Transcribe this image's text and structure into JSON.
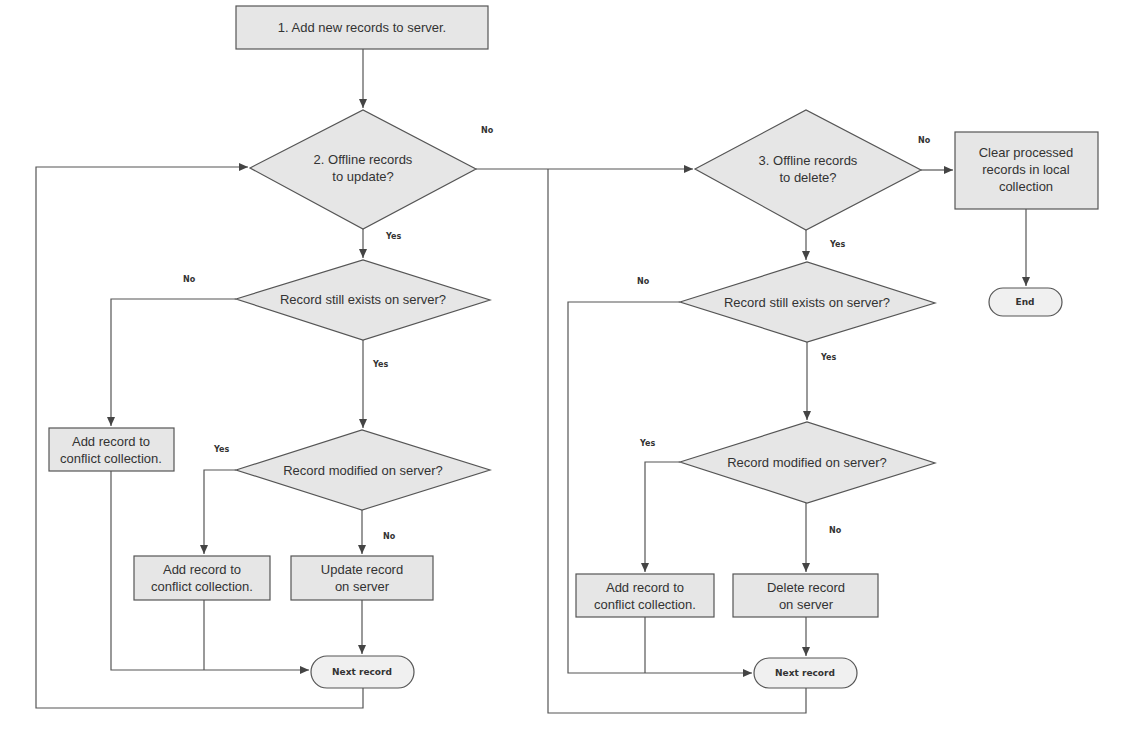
{
  "diagram": {
    "type": "flowchart",
    "colors": {
      "shape_fill": "#e6e6e6",
      "stroke": "#555555",
      "text": "#333333",
      "background": "#ffffff"
    },
    "nodes": {
      "add_new": {
        "kind": "process",
        "label": "1. Add new records to server."
      },
      "offline_update": {
        "kind": "decision",
        "line1": "2. Offline records",
        "line2": "to update?"
      },
      "offline_delete": {
        "kind": "decision",
        "line1": "3. Offline records",
        "line2": "to delete?"
      },
      "clear_processed": {
        "kind": "process",
        "line1": "Clear processed",
        "line2": "records in local",
        "line3": "collection"
      },
      "end": {
        "kind": "terminator",
        "label": "End"
      },
      "upd_exists": {
        "kind": "decision",
        "label": "Record still exists on server?"
      },
      "upd_conflict_a": {
        "kind": "process",
        "line1": "Add record to",
        "line2": "conflict collection."
      },
      "upd_modified": {
        "kind": "decision",
        "label": "Record modified on server?"
      },
      "upd_conflict_b": {
        "kind": "process",
        "line1": "Add record to",
        "line2": "conflict collection."
      },
      "upd_update": {
        "kind": "process",
        "line1": "Update record",
        "line2": "on server"
      },
      "upd_next": {
        "kind": "terminator",
        "label": "Next record"
      },
      "del_exists": {
        "kind": "decision",
        "label": "Record still exists on server?"
      },
      "del_modified": {
        "kind": "decision",
        "label": "Record modified on server?"
      },
      "del_conflict": {
        "kind": "process",
        "line1": "Add record to",
        "line2": "conflict collection."
      },
      "del_delete": {
        "kind": "process",
        "line1": "Delete record",
        "line2": "on server"
      },
      "del_next": {
        "kind": "terminator",
        "label": "Next record"
      }
    },
    "edge_labels": {
      "offline_update_no": "No",
      "offline_update_yes": "Yes",
      "offline_delete_no": "No",
      "offline_delete_yes": "Yes",
      "upd_exists_no": "No",
      "upd_exists_yes": "Yes",
      "upd_modified_yes": "Yes",
      "upd_modified_no": "No",
      "del_exists_no": "No",
      "del_exists_yes": "Yes",
      "del_modified_yes": "Yes",
      "del_modified_no": "No"
    }
  }
}
